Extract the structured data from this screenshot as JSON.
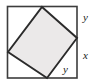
{
  "figure": {
    "canvas": {
      "width": 101,
      "height": 84,
      "background": "#ffffff"
    },
    "outer_square": {
      "name": "outer-square",
      "x": 7.5,
      "y": 6.5,
      "width": 69.5,
      "height": 71.5,
      "stroke": "#3d3d3d",
      "stroke_width": 1.6,
      "fill": "#ffffff"
    },
    "inner_square": {
      "name": "inner-tilted-square",
      "points": "42,7 77,38 47,78 8,52",
      "vertices": [
        {
          "label": "top-vertex",
          "x": 42,
          "y": 7
        },
        {
          "label": "right-vertex",
          "x": 77,
          "y": 38
        },
        {
          "label": "bottom-vertex",
          "x": 47,
          "y": 78
        },
        {
          "label": "left-vertex",
          "x": 8,
          "y": 52
        }
      ],
      "stroke": "#2b2b2b",
      "stroke_width": 1.9,
      "fill": "#ebe9e9"
    },
    "labels": [
      {
        "name": "label-y-top-right",
        "text": "y",
        "x": 83,
        "y": 12
      },
      {
        "name": "label-x-right",
        "text": "x",
        "x": 83,
        "y": 50
      },
      {
        "name": "label-y-bottom",
        "text": "y",
        "x": 63,
        "y": 64
      }
    ],
    "colors": {
      "outline": "#3d3d3d",
      "inner_outline": "#2b2b2b",
      "inner_fill": "#ebe9e9",
      "label_color": "#1a1a1a",
      "background": "#ffffff"
    }
  }
}
